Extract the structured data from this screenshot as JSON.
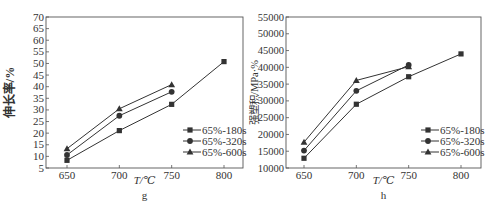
{
  "chart_data": [
    {
      "type": "line",
      "panel_label": "g",
      "title": "",
      "xlabel": "T/℃",
      "ylabel": "伸长率/%",
      "x": [
        650,
        700,
        750,
        800
      ],
      "xticks": [
        650,
        700,
        750,
        800
      ],
      "ylim": [
        5,
        70
      ],
      "yticks": [
        5,
        10,
        15,
        20,
        25,
        30,
        35,
        40,
        45,
        50,
        55,
        60,
        65,
        70
      ],
      "grid": false,
      "legend_position": "lower right",
      "series": [
        {
          "name": "65%-180s",
          "marker": "square",
          "x": [
            650,
            700,
            750,
            800
          ],
          "values": [
            8.3,
            21.1,
            32.4,
            50.8
          ]
        },
        {
          "name": "65%-320s",
          "marker": "circle",
          "x": [
            650,
            700,
            750
          ],
          "values": [
            10.6,
            27.5,
            37.8
          ]
        },
        {
          "name": "65%-600s",
          "marker": "triangle",
          "x": [
            650,
            700,
            750
          ],
          "values": [
            13.3,
            30.5,
            40.9
          ]
        }
      ]
    },
    {
      "type": "line",
      "panel_label": "h",
      "title": "",
      "xlabel": "T/℃",
      "ylabel": "强塑积/MPa·%",
      "x": [
        650,
        700,
        750,
        800
      ],
      "xticks": [
        650,
        700,
        750,
        800
      ],
      "ylim": [
        10000,
        55000
      ],
      "yticks": [
        10000,
        15000,
        20000,
        25000,
        30000,
        35000,
        40000,
        45000,
        50000,
        55000
      ],
      "grid": false,
      "legend_position": "lower right",
      "series": [
        {
          "name": "65%-180s",
          "marker": "square",
          "x": [
            650,
            700,
            750,
            800
          ],
          "values": [
            12900,
            29000,
            37200,
            44000
          ]
        },
        {
          "name": "65%-320s",
          "marker": "circle",
          "x": [
            650,
            700,
            750
          ],
          "values": [
            15200,
            33000,
            40700
          ]
        },
        {
          "name": "65%-600s",
          "marker": "triangle",
          "x": [
            650,
            700,
            750
          ],
          "values": [
            17700,
            36100,
            40200
          ]
        }
      ]
    }
  ],
  "colors": {
    "line": "#333333",
    "axis": "#555555"
  }
}
